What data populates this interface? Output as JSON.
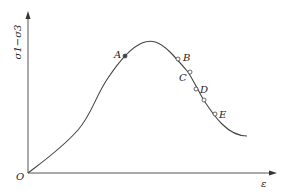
{
  "diagram": {
    "type": "stress-strain curve",
    "y_axis_label": "σ1−σ3",
    "x_axis_label": "ε",
    "origin_label": "O",
    "points": [
      {
        "label": "A",
        "x": 125,
        "y": 56,
        "filled": true
      },
      {
        "label": "B",
        "x": 178,
        "y": 59,
        "filled": false
      },
      {
        "label": "C",
        "x": 190,
        "y": 72,
        "filled": false
      },
      {
        "label": "D",
        "x": 196,
        "y": 89,
        "filled": false
      },
      {
        "label": "",
        "x": 204,
        "y": 100,
        "filled": false
      },
      {
        "label": "E",
        "x": 215,
        "y": 114,
        "filled": false
      }
    ],
    "colors": {
      "line": "#444444",
      "text": "#222222",
      "background": "#ffffff"
    }
  }
}
